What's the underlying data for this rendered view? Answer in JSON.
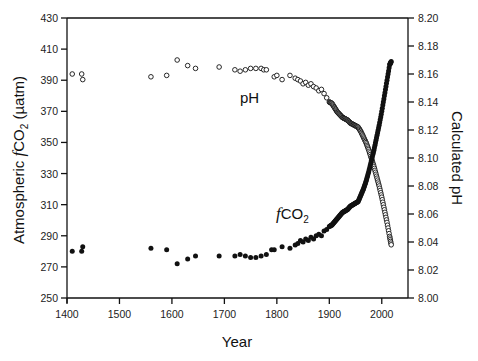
{
  "chart_data": {
    "type": "scatter",
    "title": "",
    "xlabel": "Year",
    "ylabel_left": "Atmospheric fCO2 (µatm)",
    "ylabel_right": "Calculated pH",
    "xlim": [
      1400,
      2050
    ],
    "ylim_left": [
      250,
      430
    ],
    "ylim_right": [
      8.0,
      8.2
    ],
    "grid": false,
    "legend": "none (inline annotations)",
    "x_ticks": [
      1400,
      1500,
      1600,
      1700,
      1800,
      1900,
      2000
    ],
    "y_left_ticks": [
      250,
      270,
      290,
      310,
      330,
      350,
      370,
      390,
      410,
      430
    ],
    "y_right_ticks": [
      "8.00",
      "8.02",
      "8.04",
      "8.06",
      "8.08",
      "8.10",
      "8.12",
      "8.14",
      "8.16",
      "8.18",
      "8.20"
    ],
    "annotations": [
      {
        "text": "pH",
        "near_year": 1760,
        "near_value_left": 366
      },
      {
        "text": "fCO2",
        "near_year": 1790,
        "near_value_left": 308
      }
    ],
    "series": [
      {
        "name": "fCO2",
        "axis": "left",
        "marker": "filled-circle",
        "color": "#000000",
        "points": [
          [
            1410,
            280
          ],
          [
            1428,
            280
          ],
          [
            1430,
            283
          ],
          [
            1560,
            282
          ],
          [
            1590,
            281
          ],
          [
            1610,
            272
          ],
          [
            1630,
            275
          ],
          [
            1645,
            277
          ],
          [
            1690,
            277
          ],
          [
            1720,
            277
          ],
          [
            1730,
            278
          ],
          [
            1740,
            277
          ],
          [
            1750,
            276
          ],
          [
            1760,
            276
          ],
          [
            1770,
            277
          ],
          [
            1780,
            278
          ],
          [
            1790,
            281
          ],
          [
            1795,
            281
          ],
          [
            1810,
            283
          ],
          [
            1825,
            282
          ],
          [
            1835,
            284
          ],
          [
            1840,
            285
          ],
          [
            1845,
            287
          ],
          [
            1850,
            286
          ],
          [
            1855,
            288
          ],
          [
            1860,
            287
          ],
          [
            1865,
            289
          ],
          [
            1870,
            288
          ],
          [
            1875,
            290
          ],
          [
            1880,
            291
          ],
          [
            1885,
            290
          ],
          [
            1890,
            293
          ],
          [
            1895,
            294
          ],
          [
            1900,
            296
          ],
          [
            1905,
            297
          ],
          [
            1910,
            299
          ],
          [
            1915,
            301
          ],
          [
            1920,
            303
          ],
          [
            1925,
            305
          ],
          [
            1930,
            306
          ],
          [
            1935,
            307
          ],
          [
            1940,
            309
          ],
          [
            1945,
            310
          ],
          [
            1950,
            311
          ],
          [
            1955,
            312
          ],
          [
            1960,
            316
          ],
          [
            1965,
            320
          ],
          [
            1970,
            325
          ],
          [
            1975,
            331
          ],
          [
            1980,
            338
          ],
          [
            1985,
            345
          ],
          [
            1990,
            353
          ],
          [
            1995,
            361
          ],
          [
            2000,
            370
          ],
          [
            2005,
            380
          ],
          [
            2010,
            390
          ],
          [
            2015,
            400
          ],
          [
            2018,
            402
          ]
        ]
      },
      {
        "name": "pH",
        "axis": "right",
        "marker": "open-circle",
        "color": "#000000",
        "points": [
          [
            1410,
            8.16
          ],
          [
            1428,
            8.16
          ],
          [
            1430,
            8.156
          ],
          [
            1560,
            8.158
          ],
          [
            1590,
            8.159
          ],
          [
            1610,
            8.17
          ],
          [
            1630,
            8.166
          ],
          [
            1645,
            8.164
          ],
          [
            1690,
            8.165
          ],
          [
            1720,
            8.163
          ],
          [
            1730,
            8.162
          ],
          [
            1740,
            8.163
          ],
          [
            1750,
            8.164
          ],
          [
            1760,
            8.164
          ],
          [
            1770,
            8.164
          ],
          [
            1775,
            8.163
          ],
          [
            1780,
            8.163
          ],
          [
            1795,
            8.158
          ],
          [
            1800,
            8.159
          ],
          [
            1810,
            8.156
          ],
          [
            1825,
            8.159
          ],
          [
            1835,
            8.157
          ],
          [
            1840,
            8.156
          ],
          [
            1845,
            8.155
          ],
          [
            1850,
            8.153
          ],
          [
            1855,
            8.154
          ],
          [
            1860,
            8.152
          ],
          [
            1865,
            8.153
          ],
          [
            1870,
            8.151
          ],
          [
            1875,
            8.15
          ],
          [
            1880,
            8.148
          ],
          [
            1885,
            8.149
          ],
          [
            1890,
            8.146
          ],
          [
            1895,
            8.143
          ],
          [
            1900,
            8.14
          ],
          [
            1905,
            8.139
          ],
          [
            1910,
            8.136
          ],
          [
            1915,
            8.133
          ],
          [
            1920,
            8.131
          ],
          [
            1925,
            8.129
          ],
          [
            1930,
            8.128
          ],
          [
            1935,
            8.127
          ],
          [
            1940,
            8.125
          ],
          [
            1945,
            8.124
          ],
          [
            1950,
            8.123
          ],
          [
            1955,
            8.122
          ],
          [
            1960,
            8.119
          ],
          [
            1965,
            8.115
          ],
          [
            1970,
            8.111
          ],
          [
            1975,
            8.106
          ],
          [
            1980,
            8.1
          ],
          [
            1985,
            8.094
          ],
          [
            1990,
            8.087
          ],
          [
            1995,
            8.08
          ],
          [
            2000,
            8.072
          ],
          [
            2005,
            8.063
          ],
          [
            2010,
            8.054
          ],
          [
            2015,
            8.044
          ],
          [
            2018,
            8.038
          ]
        ]
      }
    ]
  }
}
